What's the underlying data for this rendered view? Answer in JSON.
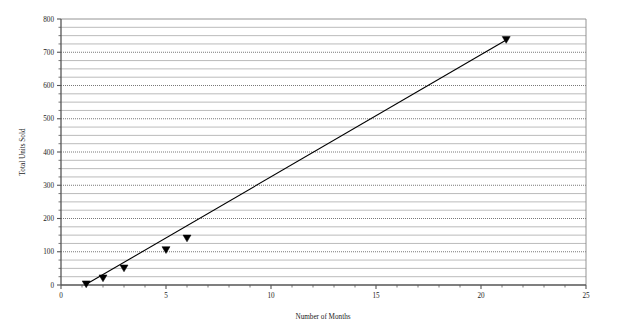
{
  "chart_data": {
    "type": "scatter",
    "title": "",
    "subtitle": "",
    "xlabel": "Number of Months",
    "ylabel": "Total Units Sold",
    "xlim": [
      0,
      25
    ],
    "ylim": [
      0,
      800
    ],
    "x_major_ticks": [
      0,
      5,
      10,
      15,
      20,
      25
    ],
    "x_major_tick_labels": [
      "0",
      "5",
      "10",
      "15",
      "20",
      "25"
    ],
    "x_minor_tick_interval": 1,
    "y_major_ticks": [
      0,
      100,
      200,
      300,
      400,
      500,
      600,
      700,
      800
    ],
    "y_major_tick_labels": [
      "0",
      "100",
      "200",
      "300",
      "400",
      "500",
      "600",
      "700",
      "800"
    ],
    "y_minor_tick_interval": 25,
    "grid": {
      "horizontal_major": true,
      "horizontal_minor": true,
      "vertical": false,
      "major_style": "dotted",
      "minor_style": "solid",
      "major_color": "#555555",
      "minor_color": "#aaaaaa"
    },
    "legend": {
      "show": false,
      "position": "none"
    },
    "series": [
      {
        "name": "Total Units Sold",
        "marker": "triangle-down-filled",
        "marker_color": "#000000",
        "line_color": "#000000",
        "has_trendline": true,
        "x": [
          1.2,
          2.0,
          3.0,
          5.0,
          6.0,
          21.2
        ],
        "y": [
          2,
          20,
          50,
          105,
          140,
          737
        ]
      }
    ],
    "trendline": {
      "from": [
        1.2,
        2
      ],
      "to": [
        21.2,
        737
      ],
      "color": "#000000",
      "width": 1.1
    },
    "plot_area": {
      "left": 61,
      "top": 19,
      "right": 586,
      "bottom": 285
    },
    "colors": {
      "axis": "#555555",
      "plot_border": "#888888",
      "data": "#000000",
      "background": "#ffffff"
    }
  }
}
